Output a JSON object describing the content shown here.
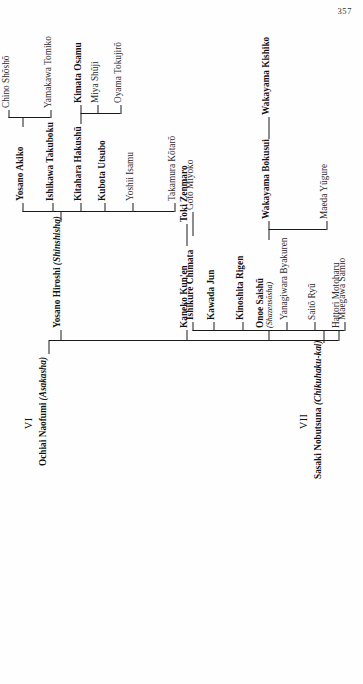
{
  "page": {
    "number": "357"
  },
  "diagram": {
    "title_hidden": "",
    "orientation": "rotated-90-ccw",
    "generations": [
      {
        "roman": "VI",
        "root": {
          "name": "Ochiai Naofumi",
          "school": "(Asakasha)",
          "weight": "bold"
        },
        "children": [
          {
            "name": "Hattori Motoharu",
            "weight": "regular"
          },
          {
            "name": "Onoe Saishū",
            "school": "(Shazensōsha)",
            "weight": "bold"
          },
          {
            "name": "Kaneko Kun'en",
            "weight": "bold"
          },
          {
            "name": "Yosano Hiroshi",
            "school": "(Shinshisha)",
            "weight": "bold"
          }
        ],
        "onoe_children": [
          {
            "name": "Maeda Yūgure",
            "weight": "regular"
          },
          {
            "name": "Wakayama Bokusui",
            "weight": "bold"
          }
        ],
        "bokusui_children": [
          {
            "name": "Wakayama Kishiko",
            "weight": "bold"
          }
        ],
        "kaneko_children": [
          {
            "name": "Toki Zenmaro",
            "weight": "bold"
          }
        ],
        "yosano_children": [
          {
            "name": "Takamura Kōtarō",
            "weight": "regular"
          },
          {
            "name": "Yoshii Isamu",
            "weight": "regular"
          },
          {
            "name": "Kubota Utsubo",
            "weight": "bold"
          },
          {
            "name": "Kitahara Hakushū",
            "weight": "bold"
          },
          {
            "name": "Ishikawa Takuboku",
            "weight": "bold"
          },
          {
            "name": "Yosano Akiko",
            "weight": "bold"
          }
        ],
        "akiko_children": [
          {
            "name": "Yamakawa Tomiko",
            "weight": "regular"
          },
          {
            "name": "Chino Shōshō",
            "weight": "regular"
          }
        ],
        "hakushu_children": [
          {
            "name": "Oyama Tokujirō",
            "weight": "regular"
          },
          {
            "name": "Miya Shūji",
            "weight": "bold"
          },
          {
            "name": "Kimata Osamu",
            "weight": "bold"
          }
        ]
      },
      {
        "roman": "VII",
        "root": {
          "name": "Sasaki Nobutsuna",
          "school": "(Chikuhaku-kai)",
          "weight": "bold"
        },
        "children": [
          {
            "name": "Maegawa Samio",
            "weight": "regular"
          },
          {
            "name": "Saitō Ryū",
            "weight": "regular"
          },
          {
            "name": "Yanagiwara Byakuren",
            "weight": "regular"
          },
          {
            "name": "Kinoshita Rigen",
            "weight": "bold"
          },
          {
            "name": "Kawada Jun",
            "weight": "bold"
          },
          {
            "name": "Ishikure Chimata",
            "weight": "bold"
          }
        ],
        "chimata_children": [
          {
            "name": "Gotō Miyoko",
            "weight": "regular"
          }
        ]
      }
    ]
  }
}
